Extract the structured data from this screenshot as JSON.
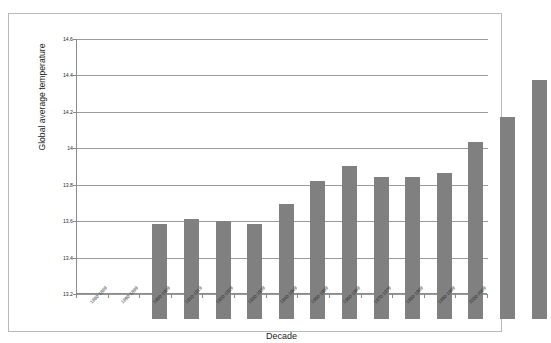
{
  "chart_data": {
    "type": "bar",
    "title": "",
    "xlabel": "Decade",
    "ylabel": "Global average temperature",
    "categories": [
      "1880-1889",
      "1890-1899",
      "1900-1909",
      "1910-1919",
      "1920-1929",
      "1930-1939",
      "1940-1949",
      "1950-1959",
      "1960-1969",
      "1970-1979",
      "1980-1989",
      "1990-1999",
      "2000-2009"
    ],
    "values": [
      13.72,
      13.75,
      13.74,
      13.72,
      13.83,
      13.96,
      14.04,
      13.98,
      13.98,
      14.0,
      14.17,
      14.31,
      14.51
    ],
    "ylim": [
      13.2,
      14.6
    ],
    "yticks": [
      13.2,
      13.4,
      13.6,
      13.8,
      14.0,
      14.2,
      14.4,
      14.6
    ],
    "ytick_labels": [
      "13.2",
      "13.4",
      "13.6",
      "13.8",
      "14",
      "14.2",
      "14.4",
      "14.6"
    ],
    "grid": true,
    "legend": false,
    "bar_color": "#808080",
    "plot_background": "#ffffff",
    "gridline_color": "#9a9a9a",
    "frame_color": "#b9b9b9"
  }
}
